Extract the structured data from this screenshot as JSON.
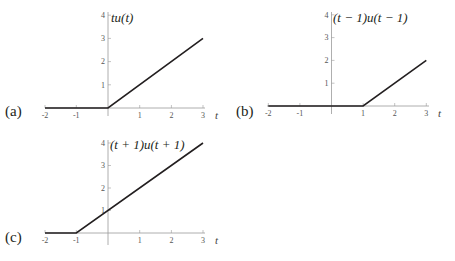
{
  "panels": [
    {
      "id": "a",
      "label": "(a)",
      "function_label": "tu(t)",
      "axis_variable": "t",
      "x_ticks": [
        "-2",
        "-1",
        "1",
        "2",
        "3"
      ],
      "y_ticks": [
        "1",
        "2",
        "3",
        "4"
      ],
      "points": [
        [
          -2,
          0
        ],
        [
          0,
          0
        ],
        [
          3,
          3
        ]
      ]
    },
    {
      "id": "b",
      "label": "(b)",
      "function_label": "(t − 1)u(t − 1)",
      "axis_variable": "t",
      "x_ticks": [
        "-2",
        "-1",
        "1",
        "2",
        "3"
      ],
      "y_ticks": [
        "1",
        "2",
        "3",
        "4"
      ],
      "points": [
        [
          -2,
          0
        ],
        [
          1,
          0
        ],
        [
          3,
          2
        ]
      ]
    },
    {
      "id": "c",
      "label": "(c)",
      "function_label": "(t + 1)u(t + 1)",
      "axis_variable": "t",
      "x_ticks": [
        "-2",
        "-1",
        "1",
        "2",
        "3"
      ],
      "y_ticks": [
        "1",
        "2",
        "3",
        "4"
      ],
      "points": [
        [
          -2,
          0
        ],
        [
          -1,
          0
        ],
        [
          3,
          4
        ]
      ]
    }
  ],
  "colors": {
    "curve": "#231f20",
    "axis": "#9a9a9a",
    "text": "#231f20"
  }
}
